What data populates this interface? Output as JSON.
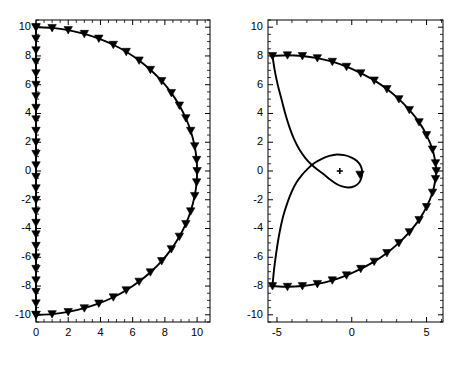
{
  "figure": {
    "background_color": "#ffffff",
    "line_color": "#000000",
    "axis_color": "#000000",
    "marker_color": "#000000",
    "width": 460,
    "height": 371
  },
  "chart_data": [
    {
      "id": "left-plot",
      "type": "line",
      "title": "",
      "xlabel": "",
      "ylabel": "",
      "xlim": [
        0,
        10.8
      ],
      "ylim": [
        -10.5,
        10.5
      ],
      "grid": false,
      "legend": null,
      "x_ticks": [
        0,
        2,
        4,
        6,
        8,
        10
      ],
      "x_tick_labels": [
        "0",
        "2",
        "4",
        "6",
        "8",
        "10"
      ],
      "y_ticks": [
        -10,
        -8,
        -6,
        -4,
        -2,
        0,
        2,
        4,
        6,
        8,
        10
      ],
      "y_tick_labels": [
        "-10",
        "-8",
        "-6",
        "-4",
        "-2",
        "0",
        "2",
        "4",
        "6",
        "8",
        "10"
      ],
      "x_minor_step": 0.5,
      "y_minor_step": 0.5,
      "marker": "triangle-down",
      "series": [
        {
          "name": "closed-arc",
          "values": [
            [
              0.0,
              10.0
            ],
            [
              1.0,
              9.95
            ],
            [
              2.0,
              9.8
            ],
            [
              3.0,
              9.54
            ],
            [
              3.9,
              9.21
            ],
            [
              4.8,
              8.78
            ],
            [
              5.6,
              8.29
            ],
            [
              6.4,
              7.69
            ],
            [
              7.1,
              7.04
            ],
            [
              7.8,
              6.26
            ],
            [
              8.4,
              5.43
            ],
            [
              8.9,
              4.56
            ],
            [
              9.3,
              3.68
            ],
            [
              9.6,
              2.8
            ],
            [
              9.85,
              1.73
            ],
            [
              9.97,
              0.78
            ],
            [
              10.0,
              0.0
            ],
            [
              9.97,
              -0.78
            ],
            [
              9.85,
              -1.73
            ],
            [
              9.6,
              -2.8
            ],
            [
              9.3,
              -3.68
            ],
            [
              8.9,
              -4.56
            ],
            [
              8.4,
              -5.43
            ],
            [
              7.8,
              -6.26
            ],
            [
              7.1,
              -7.04
            ],
            [
              6.4,
              -7.69
            ],
            [
              5.6,
              -8.29
            ],
            [
              4.8,
              -8.78
            ],
            [
              3.9,
              -9.21
            ],
            [
              3.0,
              -9.54
            ],
            [
              2.0,
              -9.8
            ],
            [
              1.0,
              -9.95
            ],
            [
              0.0,
              -10.0
            ]
          ]
        },
        {
          "name": "vertical-segment",
          "values": [
            [
              0.0,
              10.0
            ],
            [
              0.0,
              -10.0
            ]
          ]
        }
      ]
    },
    {
      "id": "right-plot",
      "type": "line",
      "title": "",
      "xlabel": "",
      "ylabel": "",
      "xlim": [
        -5.6,
        6.1
      ],
      "ylim": [
        -10.5,
        10.5
      ],
      "grid": false,
      "legend": null,
      "x_ticks": [
        -5,
        0,
        5
      ],
      "x_tick_labels": [
        "-5",
        "0",
        "5"
      ],
      "y_ticks": [
        -10,
        -8,
        -6,
        -4,
        -2,
        0,
        2,
        4,
        6,
        8,
        10
      ],
      "y_tick_labels": [
        "-10",
        "-8",
        "-6",
        "-4",
        "-2",
        "0",
        "2",
        "4",
        "6",
        "8",
        "10"
      ],
      "x_minor_step": 1,
      "y_minor_step": 0.5,
      "marker": "triangle-down",
      "center_marker": "plus",
      "center_marker_position": [
        -0.8,
        0.0
      ],
      "series": [
        {
          "name": "outer-contour",
          "values": [
            [
              -5.3,
              8.0
            ],
            [
              -4.3,
              8.05
            ],
            [
              -3.3,
              8.0
            ],
            [
              -2.3,
              7.85
            ],
            [
              -1.3,
              7.6
            ],
            [
              -0.35,
              7.25
            ],
            [
              0.6,
              6.8
            ],
            [
              1.5,
              6.3
            ],
            [
              2.35,
              5.7
            ],
            [
              3.15,
              5.0
            ],
            [
              3.85,
              4.25
            ],
            [
              4.5,
              3.4
            ],
            [
              5.0,
              2.5
            ],
            [
              5.4,
              1.5
            ],
            [
              5.6,
              0.55
            ],
            [
              5.65,
              0.0
            ],
            [
              5.6,
              -0.55
            ],
            [
              5.4,
              -1.5
            ],
            [
              5.0,
              -2.5
            ],
            [
              4.5,
              -3.4
            ],
            [
              3.85,
              -4.25
            ],
            [
              3.15,
              -5.0
            ],
            [
              2.35,
              -5.7
            ],
            [
              1.5,
              -6.3
            ],
            [
              0.6,
              -6.8
            ],
            [
              -0.35,
              -7.25
            ],
            [
              -1.3,
              -7.6
            ],
            [
              -2.3,
              -7.85
            ],
            [
              -3.3,
              -8.0
            ],
            [
              -4.3,
              -8.05
            ],
            [
              -5.3,
              -8.0
            ]
          ]
        },
        {
          "name": "inner-spiral-upper",
          "values": [
            [
              -5.3,
              8.0
            ],
            [
              -5.15,
              7.0
            ],
            [
              -4.95,
              6.0
            ],
            [
              -4.7,
              5.0
            ],
            [
              -4.45,
              4.0
            ],
            [
              -4.15,
              3.0
            ],
            [
              -3.85,
              2.2
            ],
            [
              -3.5,
              1.5
            ],
            [
              -3.1,
              0.9
            ],
            [
              -2.7,
              0.45
            ],
            [
              -2.3,
              0.1
            ],
            [
              -1.9,
              -0.2
            ],
            [
              -1.5,
              -0.55
            ],
            [
              -1.1,
              -0.85
            ],
            [
              -0.7,
              -1.05
            ],
            [
              -0.25,
              -1.15
            ],
            [
              0.2,
              -1.05
            ],
            [
              0.5,
              -0.8
            ],
            [
              0.65,
              -0.45
            ],
            [
              0.7,
              -0.05
            ],
            [
              0.6,
              0.35
            ],
            [
              0.35,
              0.7
            ],
            [
              -0.05,
              0.95
            ],
            [
              -0.5,
              1.1
            ],
            [
              -1.0,
              1.15
            ],
            [
              -1.5,
              1.05
            ],
            [
              -2.0,
              0.85
            ],
            [
              -2.5,
              0.55
            ],
            [
              -2.95,
              0.15
            ],
            [
              -3.35,
              -0.3
            ],
            [
              -3.7,
              -0.8
            ],
            [
              -4.0,
              -1.4
            ],
            [
              -4.3,
              -2.2
            ],
            [
              -4.6,
              -3.2
            ],
            [
              -4.85,
              -4.4
            ],
            [
              -5.05,
              -5.7
            ],
            [
              -5.2,
              -6.9
            ],
            [
              -5.3,
              -8.0
            ]
          ]
        }
      ]
    }
  ]
}
